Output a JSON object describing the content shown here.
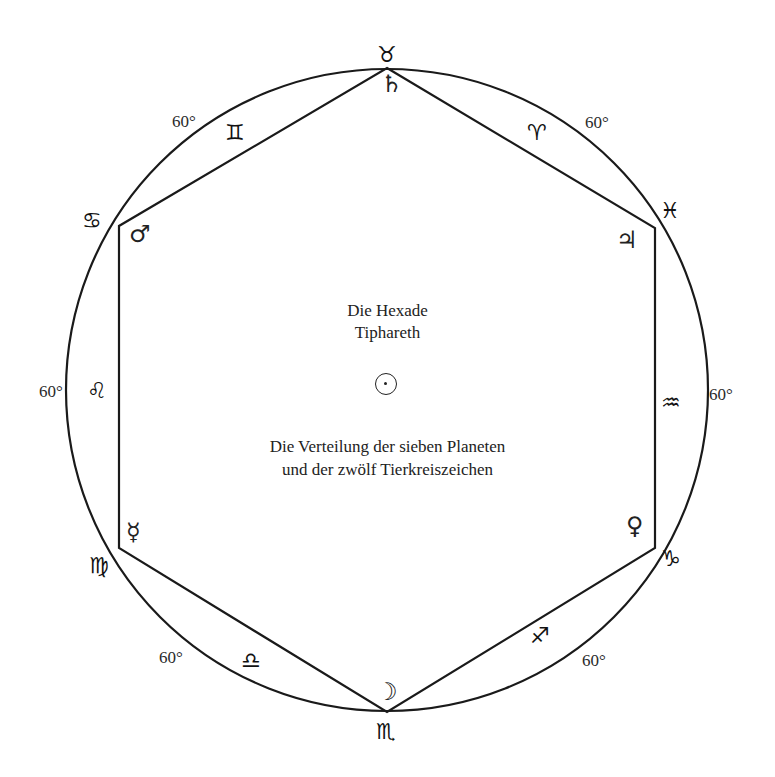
{
  "title": "Die Hexade",
  "subtitle": "Tiphareth",
  "caption_line1": "Die Verteilung der sieben Planeten",
  "caption_line2": "und der zwölf Tierkreiszeichen",
  "center_symbol": "sun-icon",
  "angles": {
    "upper_left": "60°",
    "upper_right": "60°",
    "left": "60°",
    "right": "60°",
    "lower_left": "60°",
    "lower_right": "60°"
  },
  "zodiac": {
    "taurus": "♉",
    "aries": "♈",
    "pisces": "♓",
    "aquarius": "♒",
    "capricorn": "♑",
    "sagittarius": "♐",
    "scorpio": "♏",
    "libra": "♎",
    "virgo": "♍",
    "leo": "♌",
    "cancer": "♋",
    "gemini": "♊"
  },
  "planets": {
    "saturn": "♄",
    "jupiter": "♃",
    "venus": "♀",
    "moon": "☽",
    "mercury": "☿",
    "mars": "♂",
    "sun": "☉"
  },
  "colors": {
    "line": "#1a1a1a",
    "background": "#ffffff"
  }
}
